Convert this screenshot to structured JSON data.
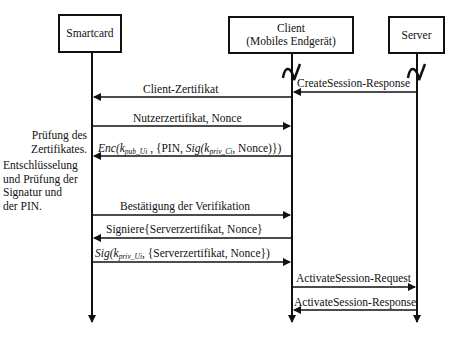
{
  "participants": {
    "smartcard": {
      "label": "Smartcard"
    },
    "client": {
      "line1": "Client",
      "line2": "(Mobiles Endgerät)"
    },
    "server": {
      "label": "Server"
    }
  },
  "messages": [
    {
      "id": "m1",
      "from": "server",
      "to": "client",
      "label": "CreateSession-Response"
    },
    {
      "id": "m2",
      "from": "client",
      "to": "smartcard",
      "label": "Client-Zertifikat"
    },
    {
      "id": "m3",
      "from": "smartcard",
      "to": "client",
      "label": "Nutzerzertifikat, Nonce"
    },
    {
      "id": "m4",
      "from": "client",
      "to": "smartcard",
      "parts": {
        "enc": "Enc(",
        "k": "k",
        "k_sub": "pub_Ui",
        "mid": " , {PIN, ",
        "sig": "Sig(",
        "k2": "k",
        "k2_sub": "priv_Ci",
        "end": ", Nonce)})"
      }
    },
    {
      "id": "m5",
      "from": "smartcard",
      "to": "client",
      "label": "Bestätigung der Verifikation"
    },
    {
      "id": "m6",
      "from": "client",
      "to": "smartcard",
      "label": "Signiere{Serverzertifikat, Nonce}"
    },
    {
      "id": "m7",
      "from": "smartcard",
      "to": "client",
      "parts": {
        "sig": "Sig(",
        "k": "k",
        "k_sub": "priv_Ui",
        "end": ", {Serverzertifikat, Nonce})"
      }
    },
    {
      "id": "m8",
      "from": "client",
      "to": "server",
      "label": "ActivateSession-Request"
    },
    {
      "id": "m9",
      "from": "server",
      "to": "client",
      "label": "ActivateSession-Response"
    }
  ],
  "notes": {
    "cert_check": {
      "line1": "Prüfung des",
      "line2": "Zertifikates."
    },
    "decrypt_check": {
      "line1": "Entschlüsselung",
      "line2": "und Prüfung der",
      "line3": "Signatur und",
      "line4": "der PIN."
    }
  }
}
